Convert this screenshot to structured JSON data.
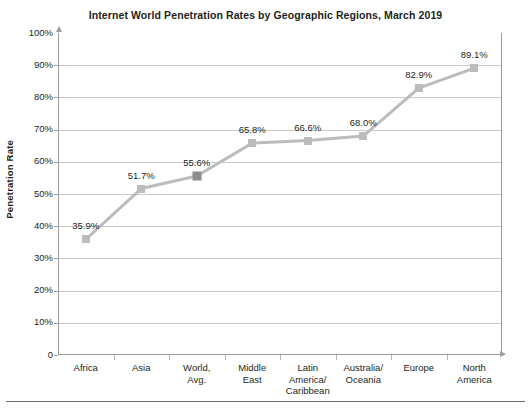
{
  "chart_data": {
    "type": "line",
    "title": "Internet World Penetration Rates by Geographic Regions, March 2019",
    "xlabel": "",
    "ylabel": "Penetration Rate",
    "ylim": [
      0,
      100
    ],
    "grid": true,
    "legend": "none",
    "categories": [
      "Africa",
      "Asia",
      "World,\nAvg.",
      "Middle\nEast",
      "Latin\nAmerica/\nCaribbean",
      "Australia/\nOceania",
      "Europe",
      "North\nAmerica"
    ],
    "category_lines": [
      [
        "Africa"
      ],
      [
        "Asia"
      ],
      [
        "World,",
        "Avg."
      ],
      [
        "Middle",
        "East"
      ],
      [
        "Latin",
        "America/",
        "Caribbean"
      ],
      [
        "Australia/",
        "Oceania"
      ],
      [
        "Europe"
      ],
      [
        "North",
        "America"
      ]
    ],
    "values": [
      35.9,
      51.7,
      55.6,
      65.8,
      66.6,
      68.0,
      82.9,
      89.1
    ],
    "point_labels": [
      "35.9%",
      "51.7%",
      "55.6%",
      "65.8%",
      "66.6%",
      "68.0%",
      "82.9%",
      "89.1%"
    ],
    "highlighted_index": 2,
    "ytick_labels": [
      "100%",
      "90%",
      "80%",
      "70%",
      "60%",
      "50%",
      "40%",
      "30%",
      "20%",
      "10%",
      "0"
    ],
    "ytick_values": [
      100,
      90,
      80,
      70,
      60,
      50,
      40,
      30,
      20,
      10,
      0
    ],
    "colors": {
      "line": "#bcbcbc",
      "marker": "#bcbcbc",
      "marker_highlight": "#8d8d8d",
      "gridline": "#c9c9c9",
      "axis": "#9d9d9d",
      "text": "#231f20"
    }
  }
}
